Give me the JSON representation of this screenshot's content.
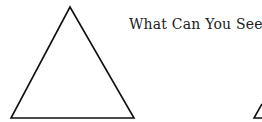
{
  "title": "What Can You See?",
  "shapes": [
    {
      "type": "triangle",
      "name": "large-triangle",
      "stroke": "#111111"
    },
    {
      "type": "triangle-partial",
      "name": "small-partial-triangle",
      "stroke": "#111111"
    }
  ]
}
